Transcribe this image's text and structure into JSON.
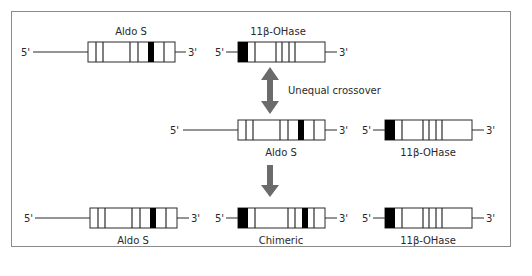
{
  "figure": {
    "colors": {
      "frame": "#8a8a8a",
      "arrow": "#6b6b6b",
      "exon_dark": "#000000",
      "line": "#2a2a2a"
    },
    "end_labels": {
      "five_prime": "5'",
      "three_prime": "3'"
    },
    "step_label": "Unequal crossover",
    "rows": [
      {
        "name": "parental-top",
        "genes": [
          {
            "label": "Aldo S",
            "label_position": "above"
          },
          {
            "label": "11β-OHase",
            "label_position": "above"
          }
        ]
      },
      {
        "name": "parental-shifted",
        "genes": [
          {
            "label": "Aldo S",
            "label_position": "below"
          },
          {
            "label": "11β-OHase",
            "label_position": "below"
          }
        ]
      },
      {
        "name": "products",
        "genes": [
          {
            "label": "Aldo S",
            "label_position": "below"
          },
          {
            "label": "Chimeric",
            "label_position": "below"
          },
          {
            "label": "11β-OHase",
            "label_position": "below"
          }
        ]
      }
    ]
  }
}
